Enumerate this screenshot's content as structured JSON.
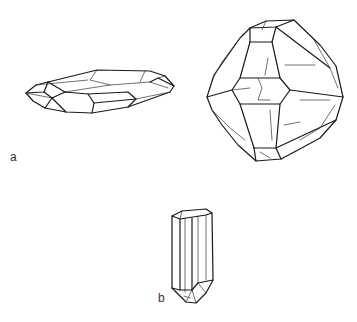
{
  "figure": {
    "labels": {
      "a": "a",
      "b": "b"
    },
    "panels": [
      {
        "id": "a",
        "description": "Two crystal habits: flattened tabular crystal (left) and bipyramidal crystal (right)"
      },
      {
        "id": "b",
        "description": "Elongated prismatic crystal with terminated end"
      }
    ],
    "colors": {
      "line": "#1a1a1a",
      "background": "#ffffff"
    }
  }
}
